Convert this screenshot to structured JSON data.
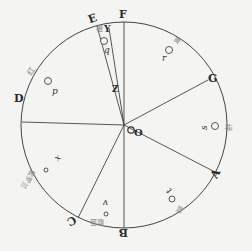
{
  "diagram": {
    "center": {
      "x": 124,
      "y": 125
    },
    "radius": 103,
    "stroke_color": "#444444",
    "background": "#f4f4f2",
    "center_labels": {
      "O": "O",
      "Z": "Z"
    },
    "points": {
      "F": "F",
      "E": "E",
      "Y": "Y",
      "G": "G",
      "A": "A",
      "B": "B",
      "C": "C",
      "D": "D"
    },
    "sector_marks": {
      "p": "p",
      "q": "q",
      "r": "r",
      "s": "s",
      "t": "t",
      "v": "v",
      "x": "x"
    },
    "color_names": {
      "red": "红",
      "orange": "橙",
      "yellow": "黄",
      "green": "绿",
      "blue": "蓝",
      "indigo": "靛蓝",
      "violet": "紫罗兰"
    }
  }
}
